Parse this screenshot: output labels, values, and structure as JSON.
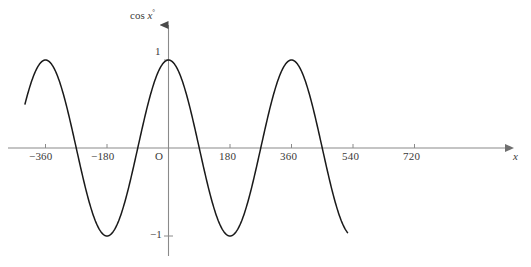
{
  "chart_data": {
    "type": "line",
    "title": "",
    "subtitle": "",
    "function": "y = cos x°",
    "xlabel": "x",
    "ylabel": "cos x°",
    "ylabel_text": "cos",
    "ylabel_var": "x",
    "ylabel_degree": "°",
    "xlim": [
      -430,
      560
    ],
    "ylim": [
      -1.35,
      1.5
    ],
    "grid": false,
    "legend": null,
    "x_ticks": [
      -360,
      -180,
      0,
      180,
      360,
      540,
      720
    ],
    "x_tick_labels": [
      "−360",
      "−180",
      "O",
      "180",
      "360",
      "540",
      "720"
    ],
    "y_ticks": [
      1,
      -1
    ],
    "y_tick_labels": [
      "1",
      "−1"
    ],
    "origin_label": "O",
    "x_domain_drawn": [
      -420,
      525
    ],
    "period": 360,
    "amplitude": 1,
    "series": [
      {
        "name": "cos x°",
        "x": [
          -420,
          -400,
          -380,
          -360,
          -340,
          -320,
          -300,
          -280,
          -260,
          -240,
          -220,
          -200,
          -180,
          -160,
          -140,
          -120,
          -100,
          -80,
          -60,
          -40,
          -20,
          0,
          20,
          40,
          60,
          80,
          100,
          120,
          140,
          160,
          180,
          200,
          220,
          240,
          260,
          280,
          300,
          320,
          340,
          360,
          380,
          400,
          420,
          440,
          460,
          480,
          500,
          520,
          525
        ],
        "y": [
          0.866,
          0.94,
          0.985,
          1.0,
          0.985,
          0.94,
          0.866,
          0.766,
          0.643,
          0.5,
          0.342,
          0.174,
          0.0,
          -0.174,
          -0.342,
          -0.5,
          -0.643,
          -0.766,
          -0.866,
          -0.94,
          -0.985,
          -1.0,
          -0.985,
          -0.94,
          -0.866,
          -0.766,
          -0.643,
          -0.5,
          -0.342,
          -0.174,
          0.0,
          0.174,
          0.342,
          0.5,
          0.643,
          0.766,
          0.866,
          0.94,
          0.985,
          1.0,
          0.985,
          0.94,
          0.866,
          0.766,
          0.643,
          0.5,
          0.342,
          0.174,
          0.13
        ]
      }
    ],
    "colors": {
      "curve": "#1a1a1a",
      "axis": "#8a8a8a",
      "text": "#3a3a3a",
      "background": "#ffffff"
    }
  },
  "axes": {
    "x_axis_name": "x",
    "y_axis_name_prefix": "cos",
    "y_axis_name_var": "x",
    "y_axis_name_degree": "°"
  },
  "ticks": {
    "x": [
      {
        "label": "−360",
        "value": -360
      },
      {
        "label": "−180",
        "value": -180
      },
      {
        "label": "180",
        "value": 180
      },
      {
        "label": "360",
        "value": 360
      },
      {
        "label": "540",
        "value": 540
      },
      {
        "label": "720",
        "value": 720
      }
    ],
    "origin": "O",
    "y": [
      {
        "label": "1",
        "value": 1
      },
      {
        "label": "−1",
        "value": -1
      }
    ]
  }
}
